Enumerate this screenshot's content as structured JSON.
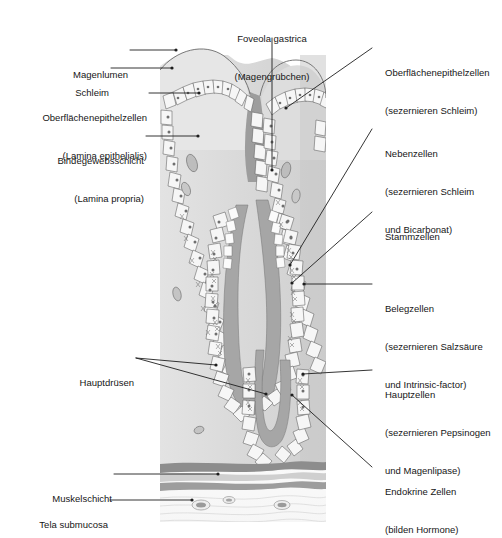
{
  "figure": {
    "type": "anatomical-diagram",
    "illustration": {
      "name": "gastric-mucosa-cross-section",
      "bounds": {
        "x": 160,
        "y": 55,
        "width": 166,
        "height": 465
      },
      "colors": {
        "lamina_propria": "#dcdcdc",
        "epithelium_fill": "#f4f4f4",
        "lumen_space": "#9a9a9a",
        "gland_lumen": "#a8a8a8",
        "muscle_layer": "#9b9b9b",
        "submucosa": "#fbfbfb",
        "outline": "#4a4a4a",
        "leader_line": "#2a2a2a"
      }
    }
  },
  "labels": {
    "top_center": {
      "name": "foveola-gastrica",
      "line1": "Foveola gastrica",
      "line2": "(Magengrübchen)"
    },
    "left": [
      {
        "name": "magenlumen",
        "line1": "Magenlumen",
        "line2": ""
      },
      {
        "name": "schleim",
        "line1": "Schleim",
        "line2": ""
      },
      {
        "name": "oberflaechenepithelzellen-lamina-epithelialis",
        "line1": "Oberflächenepithelzellen",
        "line2": "(Lamina epithelialis)"
      },
      {
        "name": "bindegewebsschicht",
        "line1": "Bindegewebsschicht",
        "line2": "(Lamina propria)"
      },
      {
        "name": "hauptdruesen",
        "line1": "Hauptdrüsen",
        "line2": ""
      },
      {
        "name": "muskelschicht",
        "line1": "Muskelschicht",
        "line2": ""
      },
      {
        "name": "tela-submucosa",
        "line1": "Tela submucosa",
        "line2": ""
      }
    ],
    "right": [
      {
        "name": "oberflaechenepithelzellen-sezernieren-schleim",
        "line1": "Oberflächenepithelzellen",
        "line2": "(sezernieren Schleim)",
        "line3": ""
      },
      {
        "name": "nebenzellen",
        "line1": "Nebenzellen",
        "line2": "(sezernieren Schleim",
        "line3": "und Bicarbonat)"
      },
      {
        "name": "stammzellen",
        "line1": "Stammzellen",
        "line2": "",
        "line3": ""
      },
      {
        "name": "belegzellen",
        "line1": "Belegzellen",
        "line2": "(sezernieren Salzsäure",
        "line3": "und Intrinsic-factor)"
      },
      {
        "name": "hauptzellen",
        "line1": "Hauptzellen",
        "line2": "(sezernieren Pepsinogen",
        "line3": "und Magenlipase)"
      },
      {
        "name": "endokrine-zellen",
        "line1": "Endokrine Zellen",
        "line2": "(bilden Hormone)",
        "line3": ""
      }
    ]
  }
}
